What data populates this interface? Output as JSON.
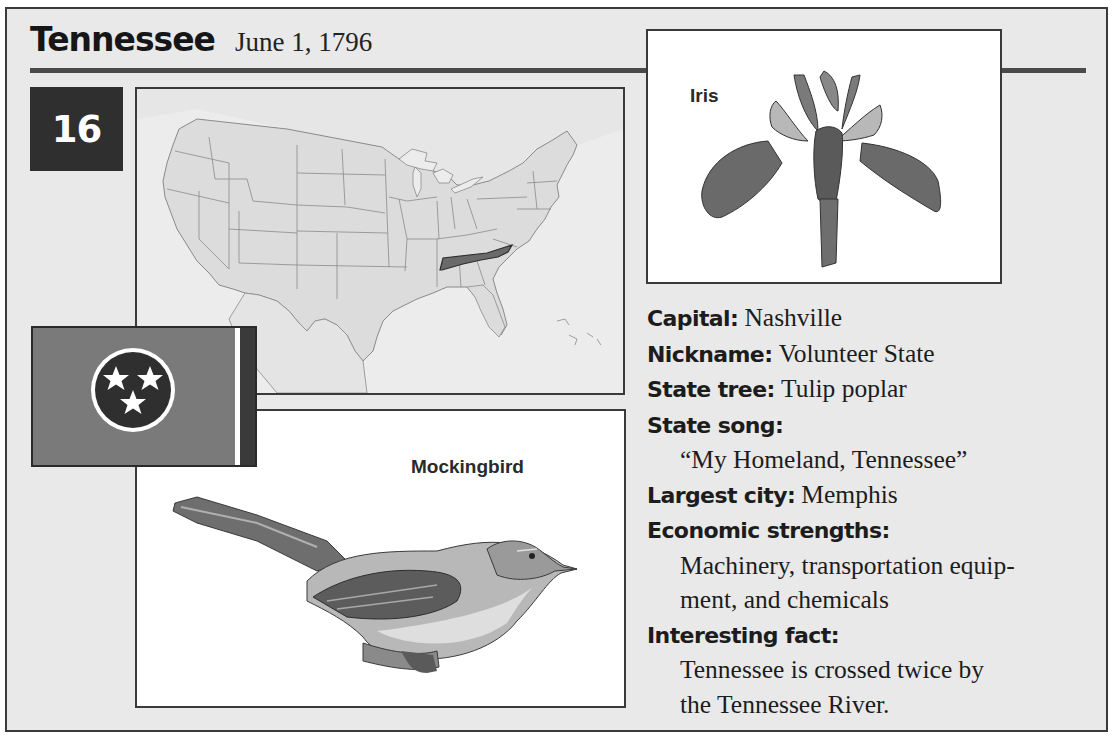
{
  "header": {
    "state_name": "Tennessee",
    "statehood_date": "June 1, 1796",
    "state_order_number": "16"
  },
  "map": {
    "highlighted_state": "Tennessee",
    "colors": {
      "land": "#dcdcdc",
      "highlight": "#6a6a6a",
      "water": "#ececec",
      "border": "#8a8a8a"
    }
  },
  "flag": {
    "icon": "tennessee-flag-three-stars",
    "colors": {
      "field": "#7a7a7a",
      "circle": "#2f2f2f",
      "stripe": "#ffffff",
      "bar": "#3a3a3a"
    }
  },
  "state_bird": {
    "label": "Mockingbird",
    "icon": "mockingbird-illustration"
  },
  "state_flower": {
    "label": "Iris",
    "icon": "iris-illustration"
  },
  "facts": {
    "capital": {
      "label": "Capital:",
      "value": "Nashville"
    },
    "nickname": {
      "label": "Nickname:",
      "value": "Volunteer State"
    },
    "state_tree": {
      "label": "State tree:",
      "value": "Tulip poplar"
    },
    "state_song": {
      "label": "State song:",
      "value": "“My Homeland, Tennessee”"
    },
    "largest_city": {
      "label": "Largest city:",
      "value": "Memphis"
    },
    "economic_strengths": {
      "label": "Economic strengths:",
      "lines": [
        "Machinery, transportation equip-",
        "ment, and chemicals"
      ]
    },
    "interesting_fact": {
      "label": "Interesting fact:",
      "lines": [
        "Tennessee is crossed twice by",
        "the Tennessee River."
      ]
    }
  }
}
